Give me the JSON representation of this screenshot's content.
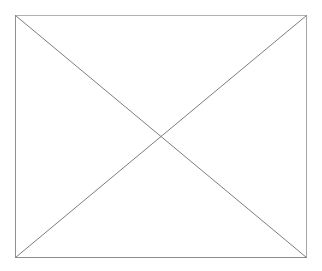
{
  "canvas": {
    "width": 322,
    "height": 271,
    "background_color": "#ffffff"
  },
  "graphic": {
    "name": "missing-image-placeholder",
    "description": "Rectangle with two crossed diagonals",
    "frame": {
      "x": 15,
      "y": 15,
      "width": 292,
      "height": 243,
      "stroke_color": "#9a9a9a",
      "stroke_color_strong": "#8a8a8a",
      "stroke_width": 1,
      "fill": "none"
    },
    "diagonals": {
      "stroke_color": "#7d7d7d",
      "stroke_width": 1,
      "lines": [
        {
          "name": "diagonal-tl-br",
          "x1": 15,
          "y1": 15,
          "x2": 307,
          "y2": 258
        },
        {
          "name": "diagonal-tr-bl",
          "x1": 307,
          "y1": 15,
          "x2": 15,
          "y2": 258
        }
      ],
      "intersection": {
        "x": 161,
        "y": 136.5
      }
    }
  }
}
